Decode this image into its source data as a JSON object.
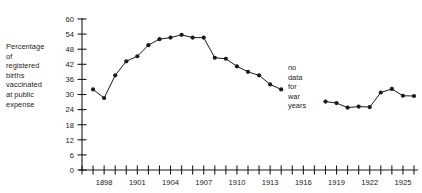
{
  "axis_caption": {
    "lines": [
      "Percentage",
      "of",
      "registered",
      "births",
      "vaccinated",
      "at public",
      "expense"
    ]
  },
  "annotation": {
    "lines": [
      "no",
      "data",
      "for",
      "war",
      "years"
    ]
  },
  "chart_data": {
    "type": "line",
    "title": "",
    "subtitle": "",
    "xlabel": "",
    "ylabel": "Percentage of registered births vaccinated at public expense",
    "xlim": [
      1896,
      1926
    ],
    "ylim": [
      0,
      60
    ],
    "grid": false,
    "legend": "none",
    "y_ticks": [
      0,
      6,
      12,
      18,
      24,
      30,
      36,
      42,
      48,
      54,
      60
    ],
    "y_tick_labels": [
      "0",
      "6",
      "12",
      "18",
      "24",
      "30",
      "36",
      "42",
      "48",
      "54",
      "60"
    ],
    "x_ticks": [
      1896,
      1897,
      1898,
      1899,
      1900,
      1901,
      1902,
      1903,
      1904,
      1905,
      1906,
      1907,
      1908,
      1909,
      1910,
      1911,
      1912,
      1913,
      1914,
      1915,
      1916,
      1917,
      1918,
      1919,
      1920,
      1921,
      1922,
      1923,
      1924,
      1925,
      1926
    ],
    "x_labeled_ticks": [
      1898,
      1901,
      1904,
      1907,
      1910,
      1913,
      1916,
      1919,
      1922,
      1925
    ],
    "x_tick_labels": [
      "1898",
      "1901",
      "1904",
      "1907",
      "1910",
      "1913",
      "1916",
      "1919",
      "1922",
      "1925"
    ],
    "marker": "filled-circle",
    "color": "#1a1a1a",
    "series": [
      {
        "name": "pre-war",
        "x": [
          1897,
          1898,
          1899,
          1900,
          1901,
          1902,
          1903,
          1904,
          1905,
          1906,
          1907,
          1908,
          1909,
          1910,
          1911,
          1912,
          1913,
          1914
        ],
        "values": [
          32.0,
          28.6,
          37.6,
          43.2,
          45.2,
          49.6,
          52.0,
          52.6,
          53.7,
          52.6,
          52.6,
          44.6,
          44.2,
          41.2,
          39.0,
          37.6,
          34.0,
          32.0
        ]
      },
      {
        "name": "post-war",
        "x": [
          1918,
          1919,
          1920,
          1921,
          1922,
          1923,
          1924,
          1925,
          1926
        ],
        "values": [
          27.2,
          26.6,
          24.8,
          25.2,
          25.0,
          30.8,
          32.2,
          29.5,
          29.4
        ]
      }
    ]
  }
}
